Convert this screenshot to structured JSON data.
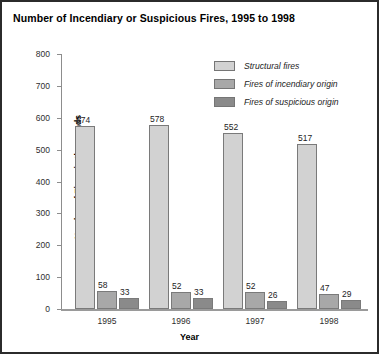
{
  "chart_data": {
    "type": "bar",
    "title": "Number of Incendiary or Suspicious Fires, 1995 to 1998",
    "xlabel": "Year",
    "ylabel": "Number of Fires, in thousands",
    "categories": [
      "1995",
      "1996",
      "1997",
      "1998"
    ],
    "series": [
      {
        "name": "Structural fires",
        "color": "#d2d2d2",
        "values": [
          574,
          578,
          552,
          517
        ]
      },
      {
        "name": "Fires of incendiary origin",
        "color": "#a8a8a8",
        "values": [
          58,
          52,
          52,
          47
        ]
      },
      {
        "name": "Fires of suspicious origin",
        "color": "#8a8a8a",
        "values": [
          33,
          33,
          26,
          29
        ]
      }
    ],
    "ylim": [
      0,
      800
    ],
    "yticks": [
      "0",
      "100",
      "200",
      "300",
      "400",
      "500",
      "600",
      "700",
      "800"
    ],
    "grid": false,
    "legend_position": "top-right",
    "show_data_labels": true
  }
}
